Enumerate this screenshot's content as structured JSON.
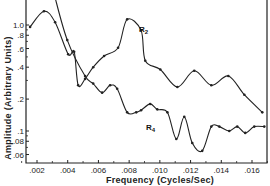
{
  "chart_data": {
    "type": "line",
    "title": "",
    "xlabel": "Frequency (Cycles/Sec)",
    "ylabel": "Amplitude (Arbitrary Units)",
    "yscale": "log",
    "xlim": [
      0.001,
      0.017
    ],
    "ylim": [
      0.05,
      1.6
    ],
    "grid": false,
    "x_ticks": [
      ".002",
      ".004",
      ".006",
      ".008",
      ".010",
      ".012",
      ".014",
      ".016"
    ],
    "y_ticks": [
      ".06",
      ".08",
      ".1",
      ".2",
      ".4",
      ".6",
      ".8",
      "1.0"
    ],
    "series": [
      {
        "name": "R2",
        "label": "R2",
        "points": [
          {
            "x": 0.00155,
            "y": 0.96
          },
          {
            "x": 0.00245,
            "y": 1.35
          },
          {
            "x": 0.00318,
            "y": 1.06
          },
          {
            "x": 0.00403,
            "y": 0.53
          },
          {
            "x": 0.00442,
            "y": 0.56
          },
          {
            "x": 0.00468,
            "y": 0.27
          },
          {
            "x": 0.00513,
            "y": 0.31
          },
          {
            "x": 0.00566,
            "y": 0.4
          },
          {
            "x": 0.00637,
            "y": 0.51
          },
          {
            "x": 0.00728,
            "y": 0.61
          },
          {
            "x": 0.00787,
            "y": 1.13
          },
          {
            "x": 0.00878,
            "y": 0.89
          },
          {
            "x": 0.00905,
            "y": 0.46
          },
          {
            "x": 0.01003,
            "y": 0.38
          },
          {
            "x": 0.01114,
            "y": 0.26
          },
          {
            "x": 0.01224,
            "y": 0.37
          },
          {
            "x": 0.01335,
            "y": 0.27
          },
          {
            "x": 0.01446,
            "y": 0.33
          },
          {
            "x": 0.0155,
            "y": 0.22
          },
          {
            "x": 0.01667,
            "y": 0.15
          }
        ]
      },
      {
        "name": "R4",
        "label": "R4",
        "points": [
          {
            "x": 0.0031,
            "y": 2.0
          },
          {
            "x": 0.00397,
            "y": 0.72
          },
          {
            "x": 0.00513,
            "y": 0.33
          },
          {
            "x": 0.00566,
            "y": 0.28
          },
          {
            "x": 0.00624,
            "y": 0.23
          },
          {
            "x": 0.00676,
            "y": 0.27
          },
          {
            "x": 0.00722,
            "y": 0.25
          },
          {
            "x": 0.00787,
            "y": 0.15
          },
          {
            "x": 0.00846,
            "y": 0.15
          },
          {
            "x": 0.00878,
            "y": 0.157
          },
          {
            "x": 0.00937,
            "y": 0.18
          },
          {
            "x": 0.00983,
            "y": 0.16
          },
          {
            "x": 0.01049,
            "y": 0.15
          },
          {
            "x": 0.01107,
            "y": 0.084
          },
          {
            "x": 0.01159,
            "y": 0.136
          },
          {
            "x": 0.01211,
            "y": 0.077
          },
          {
            "x": 0.01276,
            "y": 0.065
          },
          {
            "x": 0.01335,
            "y": 0.11
          },
          {
            "x": 0.01387,
            "y": 0.11
          },
          {
            "x": 0.01452,
            "y": 0.1
          },
          {
            "x": 0.01504,
            "y": 0.11
          },
          {
            "x": 0.01556,
            "y": 0.096
          },
          {
            "x": 0.01615,
            "y": 0.11
          },
          {
            "x": 0.0168,
            "y": 0.11
          }
        ]
      }
    ]
  }
}
